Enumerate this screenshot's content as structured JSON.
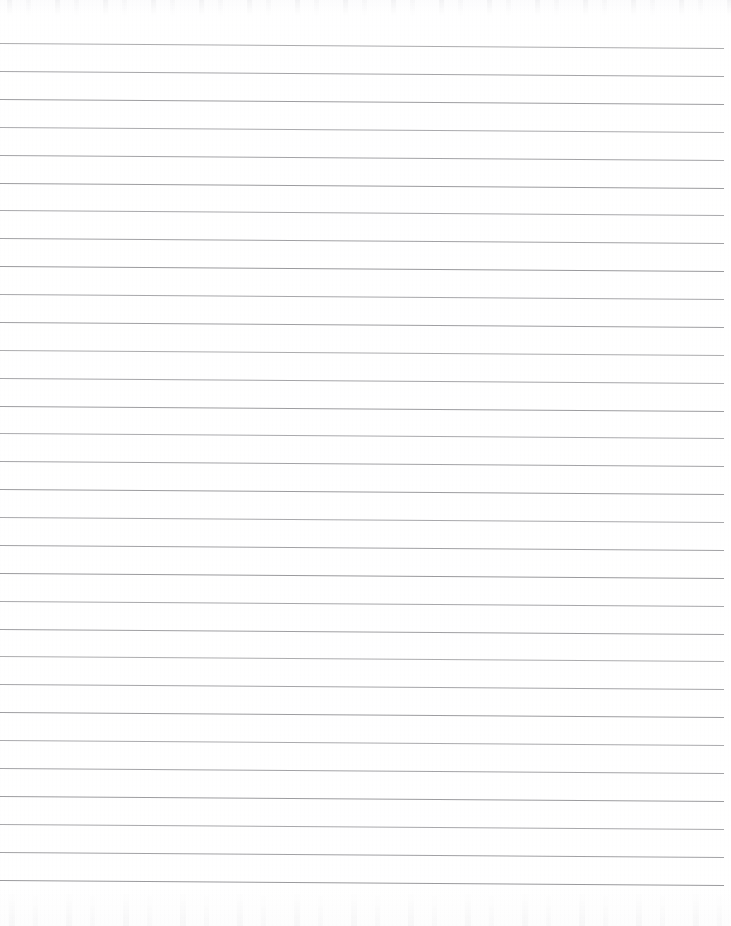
{
  "document": {
    "kind": "scanned-ruled-paper",
    "title": "Blank lined notebook paper",
    "page_width": 731,
    "page_height": 926,
    "paper_color": "#fefefe",
    "content_text": "",
    "handwriting": "none",
    "printed_text": "none"
  },
  "ruling": {
    "line_color": "#9b9b9e",
    "line_thickness_px": 1,
    "line_count": 31,
    "first_line_y": 43,
    "line_spacing_px": 27.85,
    "line_start_x": 0,
    "line_end_x": 724,
    "skew_degrees": 0.4,
    "margin_rule": "none",
    "holes": "none",
    "lines_y": [
      43,
      71,
      99,
      127,
      155,
      183,
      210,
      238,
      266,
      294,
      322,
      350,
      378,
      406,
      433,
      461,
      489,
      517,
      545,
      573,
      601,
      629,
      656,
      684,
      712,
      740,
      768,
      796,
      824,
      852,
      880
    ]
  },
  "artifacts": {
    "top_band_label": "scan-noise-top",
    "bottom_band_label": "scan-noise-bottom",
    "grain_label": "paper-grain"
  }
}
